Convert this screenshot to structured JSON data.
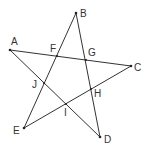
{
  "diagram": {
    "points": {
      "A": {
        "label": "A"
      },
      "B": {
        "label": "B"
      },
      "C": {
        "label": "C"
      },
      "D": {
        "label": "D"
      },
      "E": {
        "label": "E"
      },
      "F": {
        "label": "F"
      },
      "G": {
        "label": "G"
      },
      "H": {
        "label": "H"
      },
      "I": {
        "label": "I"
      },
      "J": {
        "label": "J"
      }
    },
    "segments": [
      [
        "A",
        "C"
      ],
      [
        "A",
        "D"
      ],
      [
        "B",
        "E"
      ],
      [
        "B",
        "D"
      ],
      [
        "E",
        "C"
      ]
    ],
    "line_color": "#333333"
  }
}
